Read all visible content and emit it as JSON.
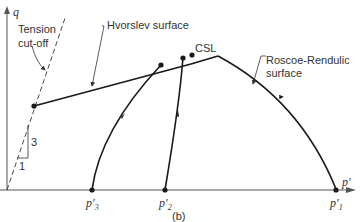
{
  "figure": {
    "caption": "(b)",
    "axes": {
      "y_label": "q",
      "x_label": "p′"
    },
    "labels": {
      "tension_line1": "Tension",
      "tension_line2": "cut-off",
      "hvorslev": "Hvorslev surface",
      "csl": "CSL",
      "roscoe_line1": "Roscoe-Rendulic",
      "roscoe_line2": "surface",
      "slope_rise": "3",
      "slope_run": "1"
    },
    "points": [
      {
        "name": "p3",
        "base": "p′",
        "sub": "3"
      },
      {
        "name": "p2",
        "base": "p′",
        "sub": "2"
      },
      {
        "name": "p1",
        "base": "p′",
        "sub": "1"
      }
    ],
    "colors": {
      "line": "#1a1a1a",
      "axis": "#555555",
      "text": "#333333"
    }
  }
}
